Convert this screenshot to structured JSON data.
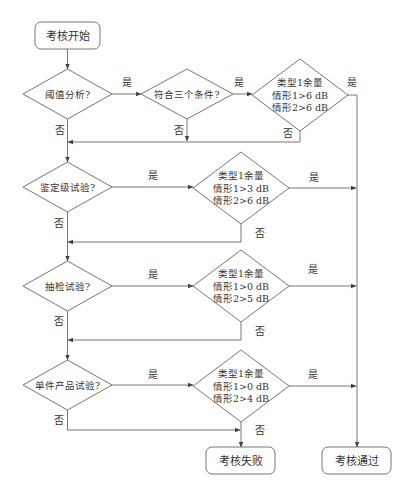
{
  "diagram": {
    "type": "flowchart",
    "nodes": {
      "start": {
        "label": "考核开始",
        "shape": "terminal"
      },
      "threshold": {
        "label": "阈值分析?",
        "shape": "decision"
      },
      "three_conditions": {
        "label": "符合三个条件?",
        "shape": "decision"
      },
      "cond1": {
        "lines": [
          "类型1余量",
          "情形1>6 dB",
          "情形2>6 dB"
        ],
        "shape": "decision"
      },
      "qualification": {
        "label": "鉴定级试验?",
        "shape": "decision"
      },
      "cond2": {
        "lines": [
          "类型1余量",
          "情形1>3 dB",
          "情形2>6 dB"
        ],
        "shape": "decision"
      },
      "sampling": {
        "label": "抽检试验?",
        "shape": "decision"
      },
      "cond3": {
        "lines": [
          "类型1余量",
          "情形1>0 dB",
          "情形2>5 dB"
        ],
        "shape": "decision"
      },
      "single_product": {
        "label": "单件产品试验?",
        "shape": "decision"
      },
      "cond4": {
        "lines": [
          "类型1余量",
          "情形1>0 dB",
          "情形2>4 dB"
        ],
        "shape": "decision"
      },
      "fail": {
        "label": "考核失败",
        "shape": "terminal"
      },
      "pass": {
        "label": "考核通过",
        "shape": "terminal"
      }
    },
    "edge_labels": {
      "yes": "是",
      "no": "否"
    },
    "edges": [
      {
        "from": "start",
        "to": "threshold"
      },
      {
        "from": "threshold",
        "to": "three_conditions",
        "label": "是"
      },
      {
        "from": "threshold",
        "to": "qualification",
        "label": "否"
      },
      {
        "from": "three_conditions",
        "to": "cond1",
        "label": "是"
      },
      {
        "from": "three_conditions",
        "to": "qualification",
        "label": "否"
      },
      {
        "from": "cond1",
        "to": "pass",
        "label": "是"
      },
      {
        "from": "cond1",
        "to": "qualification",
        "label": "否"
      },
      {
        "from": "qualification",
        "to": "cond2",
        "label": "是"
      },
      {
        "from": "qualification",
        "to": "sampling",
        "label": "否"
      },
      {
        "from": "cond2",
        "to": "pass",
        "label": "是"
      },
      {
        "from": "cond2",
        "to": "sampling",
        "label": "否"
      },
      {
        "from": "sampling",
        "to": "cond3",
        "label": "是"
      },
      {
        "from": "sampling",
        "to": "single_product",
        "label": "否"
      },
      {
        "from": "cond3",
        "to": "pass",
        "label": "是"
      },
      {
        "from": "cond3",
        "to": "single_product",
        "label": "否"
      },
      {
        "from": "single_product",
        "to": "cond4",
        "label": "是"
      },
      {
        "from": "single_product",
        "to": "fail",
        "label": "否"
      },
      {
        "from": "cond4",
        "to": "pass",
        "label": "是"
      },
      {
        "from": "cond4",
        "to": "fail",
        "label": "否"
      }
    ]
  }
}
